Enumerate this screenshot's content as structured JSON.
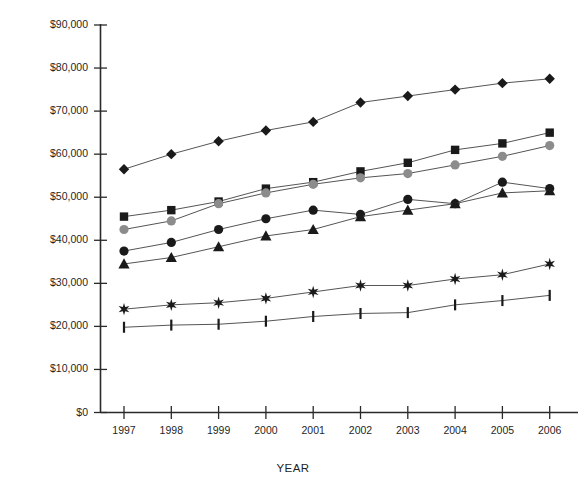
{
  "chart_data": {
    "type": "line",
    "title": "",
    "xlabel": "YEAR",
    "ylabel": "ANNUAL COMPENSATION",
    "x": [
      1997,
      1998,
      1999,
      2000,
      2001,
      2002,
      2003,
      2004,
      2005,
      2006
    ],
    "categories": [
      "1997",
      "1998",
      "1999",
      "2000",
      "2001",
      "2002",
      "2003",
      "2004",
      "2005",
      "2006"
    ],
    "ylim": [
      0,
      90000
    ],
    "ytick_values": [
      0,
      10000,
      20000,
      30000,
      40000,
      50000,
      60000,
      70000,
      80000,
      90000
    ],
    "ytick_labels": [
      "$0",
      "$10,000",
      "$20,000",
      "$30,000",
      "$40,000",
      "$50,000",
      "$60,000",
      "$70,000",
      "$80,000",
      "$90,000"
    ],
    "grid": false,
    "legend": "none",
    "series": [
      {
        "name": "series-diamond",
        "marker": "diamond",
        "color": "#1a1a1a",
        "values": [
          56500,
          60000,
          63000,
          65500,
          67500,
          72000,
          73500,
          75000,
          76500,
          77500
        ]
      },
      {
        "name": "series-square",
        "marker": "square",
        "color": "#1a1a1a",
        "values": [
          45500,
          47000,
          49000,
          52000,
          53500,
          56000,
          58000,
          61000,
          62500,
          65000
        ]
      },
      {
        "name": "series-gray-circle",
        "marker": "circle-gray",
        "color": "#8c8c8c",
        "values": [
          42500,
          44500,
          48500,
          51000,
          53000,
          54500,
          55500,
          57500,
          59500,
          62000
        ]
      },
      {
        "name": "series-black-circle",
        "marker": "circle",
        "color": "#1a1a1a",
        "values": [
          37500,
          39500,
          42500,
          45000,
          47000,
          46000,
          49500,
          48500,
          53500,
          52000
        ]
      },
      {
        "name": "series-triangle",
        "marker": "triangle",
        "color": "#1a1a1a",
        "values": [
          34500,
          36000,
          38500,
          41000,
          42500,
          45500,
          47000,
          48500,
          51000,
          51500
        ]
      },
      {
        "name": "series-star",
        "marker": "star",
        "color": "#1a1a1a",
        "values": [
          24000,
          25000,
          25500,
          26500,
          28000,
          29500,
          29500,
          31000,
          32000,
          34500
        ]
      },
      {
        "name": "series-tick",
        "marker": "bar",
        "color": "#1a1a1a",
        "values": [
          19800,
          20300,
          20500,
          21200,
          22300,
          23000,
          23200,
          25000,
          26000,
          27200
        ]
      }
    ]
  }
}
